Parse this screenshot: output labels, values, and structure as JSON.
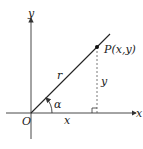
{
  "diagram": {
    "labels": {
      "y_axis": "y",
      "x_axis": "x",
      "origin": "O",
      "point": "P(x,y)",
      "radius": "r",
      "angle": "α",
      "x_leg": "x",
      "y_leg": "y"
    },
    "colors": {
      "line": "#222222",
      "axis": "#333333",
      "dashed": "#555555"
    }
  }
}
